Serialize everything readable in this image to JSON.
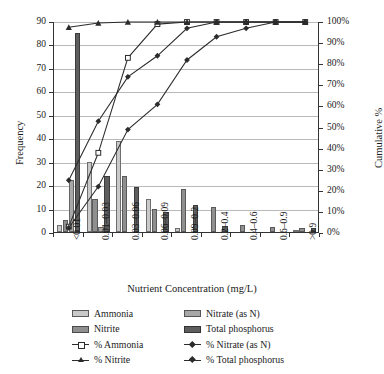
{
  "chart_data": {
    "type": "bar",
    "title": "",
    "xlabel": "Nutrient Concentration (mg/L)",
    "ylabel": "Frequency",
    "y2label": "Cumulative %",
    "categories": [
      "<0.01",
      "0.01–0.03",
      "0.03–0.06",
      "0.06–0.09",
      "0.09–0.2",
      "0.2–0.4",
      "0.4–0.6",
      "0.6–0.9",
      ">0.9"
    ],
    "ylim": [
      0,
      90
    ],
    "yticks": [
      "0",
      "10",
      "20",
      "30",
      "40",
      "50",
      "60",
      "70",
      "80",
      "90"
    ],
    "y2lim": [
      0,
      100
    ],
    "y2ticks": [
      "0%",
      "10%",
      "20%",
      "30%",
      "40%",
      "50%",
      "60%",
      "70%",
      "80%",
      "90%",
      "100%"
    ],
    "grid": true,
    "legend_position": "bottom",
    "series": [
      {
        "name": "Ammonia",
        "kind": "bar",
        "color": "#c9c9c9",
        "values": [
          3,
          30,
          39,
          14,
          1.5,
          0,
          0,
          0,
          1
        ]
      },
      {
        "name": "Nitrite",
        "kind": "bar",
        "color": "#8f8f8f",
        "values": [
          5,
          14,
          24,
          10,
          18.5,
          10.5,
          3,
          2,
          1.5
        ]
      },
      {
        "name": "Nitrate (as N)",
        "kind": "bar",
        "color": "#a8a8a8",
        "values": [
          22,
          2,
          0,
          0,
          0,
          0,
          0,
          0,
          0
        ]
      },
      {
        "name": "Total phosphorus",
        "kind": "bar",
        "color": "#5e5e5e",
        "values": [
          85,
          24,
          19,
          8.5,
          11.5,
          2.5,
          0,
          0,
          1.5
        ]
      },
      {
        "name": "% Ammonia",
        "kind": "line",
        "marker": "square-open",
        "values": [
          3,
          38,
          83,
          99,
          100,
          100,
          100,
          100,
          100
        ]
      },
      {
        "name": "% Nitrite",
        "kind": "line",
        "marker": "triangle",
        "values": [
          97.5,
          99.5,
          100,
          100,
          100,
          100,
          100,
          100,
          100
        ]
      },
      {
        "name": "% Nitrate (as N)",
        "kind": "line",
        "marker": "diamond",
        "values": [
          25,
          53,
          74,
          84,
          97,
          100,
          100,
          100,
          100
        ]
      },
      {
        "name": "% Total phosphorus",
        "kind": "line",
        "marker": "diamond",
        "values": [
          2.5,
          22,
          49,
          61,
          82,
          93,
          97,
          100,
          100
        ]
      }
    ]
  },
  "axes": {
    "y_title": "Frequency",
    "y2_title": "Cumulative %",
    "x_title": "Nutrient Concentration (mg/L)"
  },
  "legend": {
    "items": [
      {
        "label": "Ammonia",
        "type": "swatch",
        "style": "s0",
        "marker": ""
      },
      {
        "label": "Nitrate (as N)",
        "type": "swatch",
        "style": "s2",
        "marker": ""
      },
      {
        "label": "Nitrite",
        "type": "swatch",
        "style": "s1",
        "marker": ""
      },
      {
        "label": "Total phosphorus",
        "type": "swatch",
        "style": "s3",
        "marker": ""
      },
      {
        "label": "% Ammonia",
        "type": "line",
        "style": "",
        "marker": "sq-open"
      },
      {
        "label": "% Nitrate (as N)",
        "type": "line",
        "style": "",
        "marker": "dia"
      },
      {
        "label": "% Nitrite",
        "type": "line",
        "style": "",
        "marker": "tri"
      },
      {
        "label": "% Total phosphorus",
        "type": "line",
        "style": "",
        "marker": "dia"
      }
    ]
  }
}
